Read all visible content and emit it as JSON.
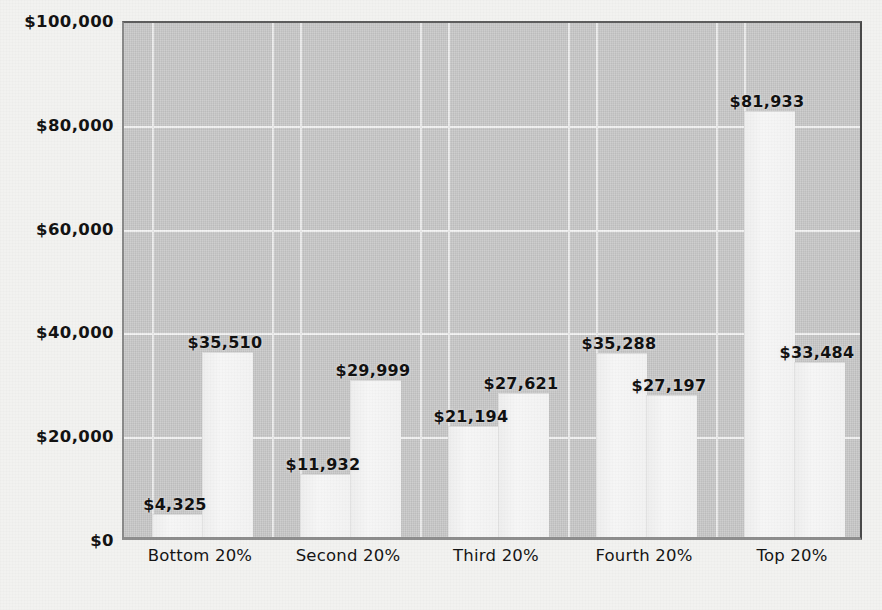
{
  "chart_data": {
    "type": "bar",
    "title": "",
    "subtitle": "",
    "xlabel": "",
    "ylabel": "",
    "ylim": [
      0,
      100000
    ],
    "ytick_values": [
      0,
      20000,
      40000,
      60000,
      80000,
      100000
    ],
    "ytick_labels": [
      "$0",
      "$20,000",
      "$40,000",
      "$60,000",
      "$80,000",
      "$100,000"
    ],
    "grid": true,
    "legend": "none",
    "categories": [
      "Bottom 20%",
      "Second 20%",
      "Third 20%",
      "Fourth 20%",
      "Top 20%"
    ],
    "series": [
      {
        "name": "Series 1",
        "values": [
          4325,
          11932,
          21194,
          35288,
          81933
        ],
        "labels": [
          "$4,325",
          "$11,932",
          "$21,194",
          "$35,288",
          "$81,933"
        ]
      },
      {
        "name": "Series 2",
        "values": [
          35510,
          29999,
          27621,
          27197,
          33484
        ],
        "labels": [
          "$35,510",
          "$29,999",
          "$27,621",
          "$27,197",
          "$33,484"
        ]
      }
    ],
    "bars": [
      {
        "category": "Bottom 20%",
        "series": "Series 1",
        "value": 4325,
        "label": "$4,325"
      },
      {
        "category": "Bottom 20%",
        "series": "Series 2",
        "value": 35510,
        "label": "$35,510"
      },
      {
        "category": "Second 20%",
        "series": "Series 1",
        "value": 11932,
        "label": "$11,932"
      },
      {
        "category": "Second 20%",
        "series": "Series 2",
        "value": 29999,
        "label": "$29,999"
      },
      {
        "category": "Third 20%",
        "series": "Series 1",
        "value": 21194,
        "label": "$21,194"
      },
      {
        "category": "Third 20%",
        "series": "Series 2",
        "value": 27621,
        "label": "$27,621"
      },
      {
        "category": "Fourth 20%",
        "series": "Series 1",
        "value": 35288,
        "label": "$35,288"
      },
      {
        "category": "Fourth 20%",
        "series": "Series 2",
        "value": 27197,
        "label": "$27,197"
      },
      {
        "category": "Top 20%",
        "series": "Series 1",
        "value": 81933,
        "label": "$81,933"
      },
      {
        "category": "Top 20%",
        "series": "Series 2",
        "value": 33484,
        "label": "$33,484"
      }
    ],
    "colors": {
      "plot_background": "#c6c6c6",
      "bar_fill": "#f4f4f4",
      "gridline": "#f4f4f4",
      "text": "#131313",
      "page_background": "#f2f2f0"
    }
  }
}
